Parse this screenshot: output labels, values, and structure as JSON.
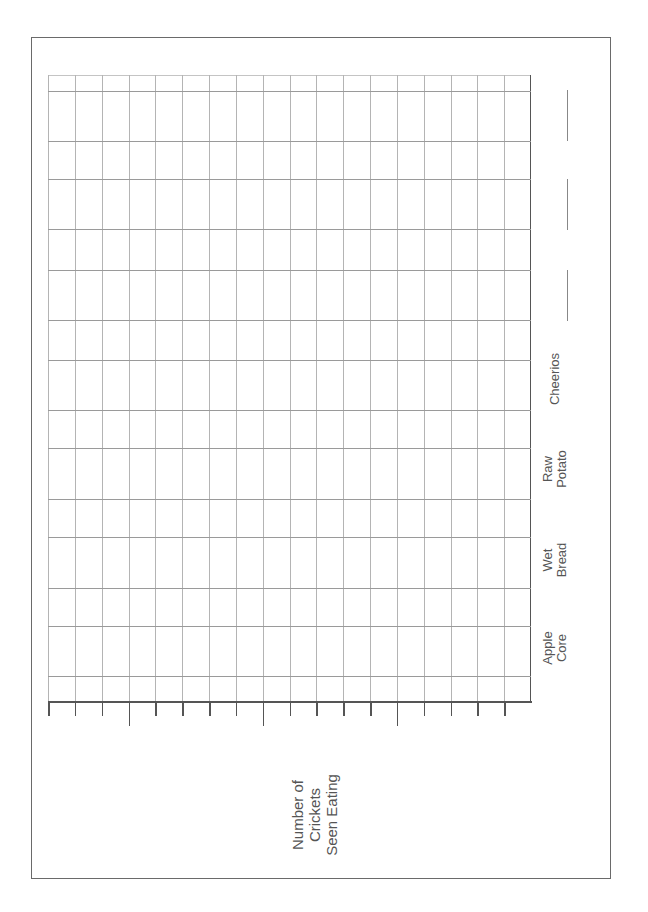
{
  "worksheet": {
    "orientation": "rotated -90deg",
    "border_color": "#6a6a6a"
  },
  "chart_data": {
    "type": "bar",
    "title": "",
    "orientation": "horizontal (page rotated)",
    "categories": [
      "Apple Core",
      "Wet Bread",
      "Raw Potato",
      "Cheerios",
      "",
      "",
      ""
    ],
    "values": [
      null,
      null,
      null,
      null,
      null,
      null,
      null
    ],
    "blank_category_slots": 3,
    "xlabel": "",
    "ylabel": "Number of Crickets Seen Eating",
    "value_axis_ticks": 18,
    "major_tick_every": 5,
    "grid": true,
    "note": "Blank graph worksheet; no data plotted"
  },
  "labels": {
    "apple_core": "Apple\nCore",
    "wet_bread": "Wet\nBread",
    "raw_potato": "Raw\nPotato",
    "cheerios": "Cheerios",
    "axis_title": "Number of\nCrickets\nSeen Eating"
  }
}
